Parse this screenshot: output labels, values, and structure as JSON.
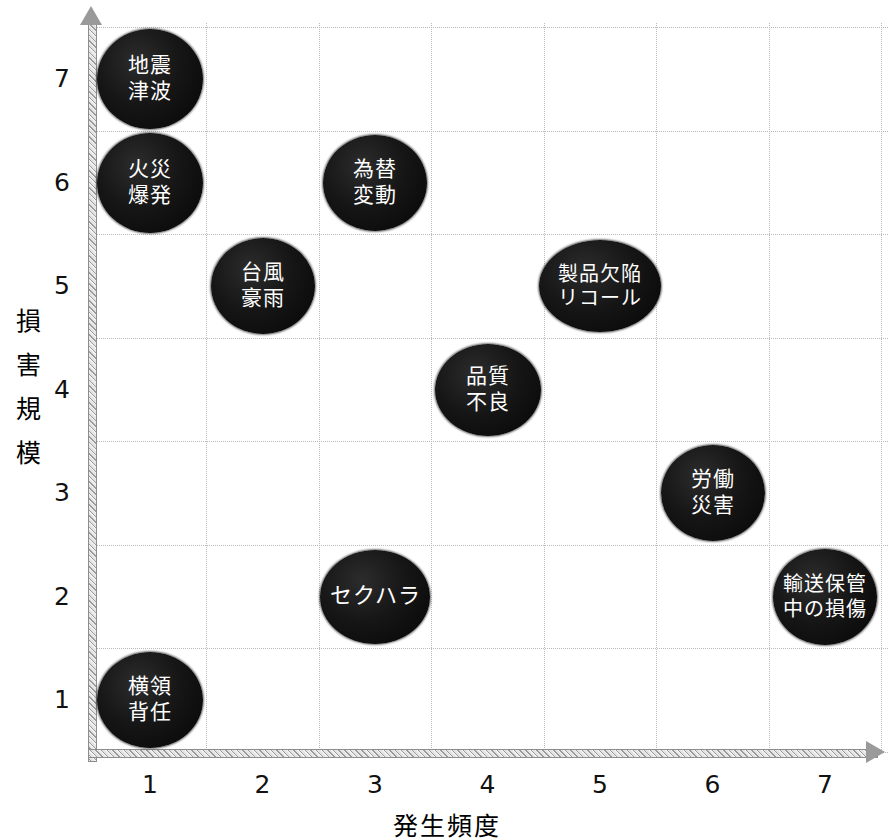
{
  "chart_data": {
    "type": "scatter",
    "title": "",
    "xlabel": "発生頻度",
    "ylabel": "損害規模",
    "xlim": [
      0.5,
      7.5
    ],
    "ylim": [
      0.5,
      7.5
    ],
    "xticks": [
      "1",
      "2",
      "3",
      "4",
      "5",
      "6",
      "7"
    ],
    "yticks": [
      "1",
      "2",
      "3",
      "4",
      "5",
      "6",
      "7"
    ],
    "grid": true,
    "legend": "none",
    "points": [
      {
        "label": "地震\n津波",
        "x": 1,
        "y": 7,
        "w": 106,
        "h": 100
      },
      {
        "label": "火災\n爆発",
        "x": 1,
        "y": 6,
        "w": 106,
        "h": 100
      },
      {
        "label": "為替\n変動",
        "x": 3,
        "y": 6,
        "w": 104,
        "h": 96
      },
      {
        "label": "台風\n豪雨",
        "x": 2,
        "y": 5,
        "w": 104,
        "h": 96
      },
      {
        "label": "製品欠陥\nリコール",
        "x": 5,
        "y": 5,
        "w": 122,
        "h": 92
      },
      {
        "label": "品質\n不良",
        "x": 4,
        "y": 4,
        "w": 106,
        "h": 92
      },
      {
        "label": "労働\n災害",
        "x": 6,
        "y": 3,
        "w": 104,
        "h": 96
      },
      {
        "label": "セクハラ",
        "x": 3,
        "y": 2,
        "w": 110,
        "h": 94
      },
      {
        "label": "輸送保管\n中の損傷",
        "x": 7,
        "y": 2,
        "w": 104,
        "h": 96
      },
      {
        "label": "横領\n背任",
        "x": 1,
        "y": 1,
        "w": 106,
        "h": 96
      }
    ]
  },
  "axes": {
    "x_title": "発生頻度",
    "y_title": "損害規模",
    "y_title_chars": [
      "損",
      "害",
      "規",
      "模"
    ]
  },
  "colors": {
    "bubble_fill": "#0d0d0d",
    "bubble_text": "#ffffff",
    "grid": "#b9b9b9",
    "axis": "#9a9a9a",
    "background": "#ffffff"
  }
}
